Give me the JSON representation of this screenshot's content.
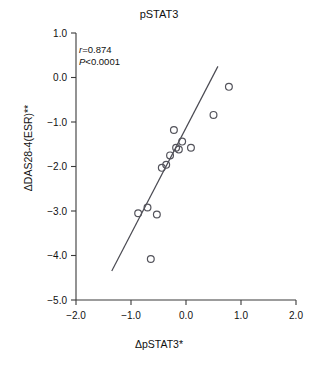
{
  "chart_data": {
    "type": "scatter",
    "title": "pSTAT3",
    "xlabel": "ΔpSTAT3*",
    "ylabel": "ΔDAS28-4(ESR)**",
    "xlim": [
      -2.0,
      2.0
    ],
    "ylim": [
      -5.0,
      1.0
    ],
    "xticks": [
      -2.0,
      -1.0,
      0.0,
      1.0,
      2.0
    ],
    "yticks": [
      1.0,
      0.0,
      -1.0,
      -2.0,
      -3.0,
      -4.0,
      -5.0
    ],
    "xticklabels": [
      "−2.0",
      "−1.0",
      "0.0",
      "1.0",
      "2.0"
    ],
    "yticklabels": [
      "1.0",
      "0.0",
      "−1.0",
      "−2.0",
      "−3.0",
      "−4.0",
      "−5.0"
    ],
    "grid": false,
    "legend": "none",
    "marker_style": "open-circle",
    "points": [
      {
        "x": -0.87,
        "y": -3.05
      },
      {
        "x": -0.7,
        "y": -2.92
      },
      {
        "x": -0.64,
        "y": -4.08
      },
      {
        "x": -0.53,
        "y": -3.08
      },
      {
        "x": -0.44,
        "y": -2.03
      },
      {
        "x": -0.36,
        "y": -1.96
      },
      {
        "x": -0.29,
        "y": -1.75
      },
      {
        "x": -0.22,
        "y": -1.18
      },
      {
        "x": -0.18,
        "y": -1.58
      },
      {
        "x": -0.13,
        "y": -1.62
      },
      {
        "x": -0.07,
        "y": -1.44
      },
      {
        "x": 0.09,
        "y": -1.58
      },
      {
        "x": 0.5,
        "y": -0.84
      },
      {
        "x": 0.78,
        "y": -0.21
      }
    ],
    "fit_line": {
      "x0": -1.35,
      "y0": -4.35,
      "x1": 0.58,
      "y1": 0.25
    },
    "annotations": {
      "r_prefix": "r",
      "r_value": "=0.874",
      "p_prefix": "P",
      "p_value": "<0.0001"
    }
  }
}
